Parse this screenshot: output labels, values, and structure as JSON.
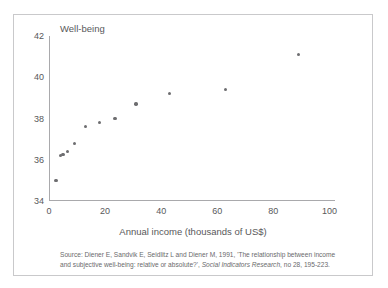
{
  "figure": {
    "y_axis_title": "Well-being",
    "x_axis_title": "Annual income  (thousands of US$)",
    "source_prefix": "Source: Diener E, Sandvik E, Seidlitz L and Diener M, 1991, 'The relationship between income and subjective well-being: relative or absolute?', ",
    "source_journal": "Social Indicators Research",
    "source_suffix": ", no 28, 195-223.",
    "border_color": "#c9c9cb",
    "axis_color": "#a9a9ac",
    "marker_color": "#6d6d70",
    "text_color": "#58585a"
  },
  "chart_data": {
    "type": "scatter",
    "title": "",
    "xlabel": "Annual income  (thousands of US$)",
    "ylabel": "Well-being",
    "xlim": [
      0,
      102
    ],
    "ylim": [
      34,
      42
    ],
    "xticks": [
      0,
      20,
      40,
      60,
      80,
      100
    ],
    "yticks": [
      34,
      36,
      38,
      40,
      42
    ],
    "xtick_labels": [
      "0",
      "20",
      "40",
      "60",
      "80",
      "100"
    ],
    "ytick_labels": [
      "34",
      "36",
      "38",
      "40",
      "42"
    ],
    "grid": false,
    "legend": false,
    "series": [
      {
        "name": "Income vs well-being",
        "x": [
          2.5,
          4.0,
          5.0,
          6.5,
          9.0,
          13.0,
          18.0,
          23.5,
          31.0,
          43.0,
          63.0,
          89.0
        ],
        "y": [
          35.0,
          36.2,
          36.25,
          36.4,
          36.8,
          37.6,
          37.8,
          38.0,
          38.7,
          39.2,
          39.4,
          41.1
        ]
      }
    ]
  }
}
